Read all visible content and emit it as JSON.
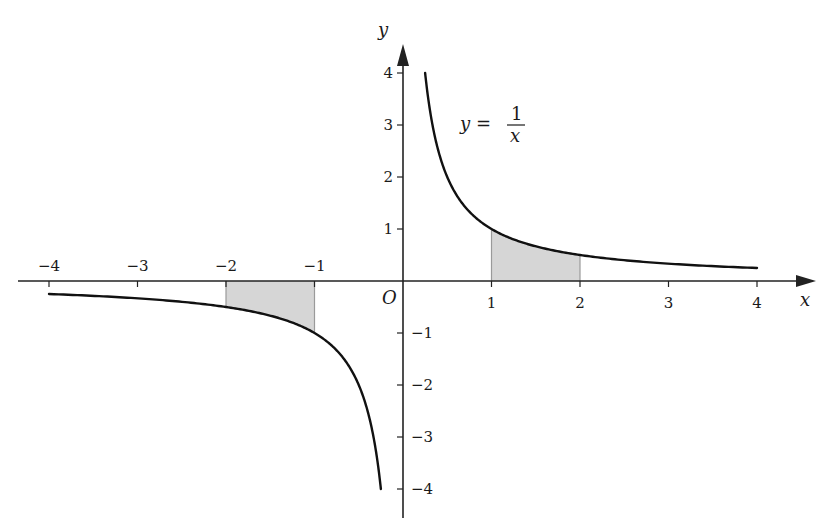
{
  "chart_data": {
    "type": "line",
    "title": "",
    "function": "y = 1/x",
    "xlabel": "x",
    "ylabel": "y",
    "origin_label": "O",
    "xlim": [
      -4.5,
      4.5
    ],
    "ylim": [
      -4.5,
      4.5
    ],
    "grid": false,
    "x_ticks": [
      -4,
      -3,
      -2,
      -1,
      1,
      2,
      3,
      4
    ],
    "y_ticks": [
      -4,
      -3,
      -2,
      -1,
      1,
      2,
      3,
      4
    ],
    "x_tick_labels": [
      "−4",
      "−3",
      "−2",
      "−1",
      "1",
      "2",
      "3",
      "4"
    ],
    "y_tick_labels": [
      "−4",
      "−3",
      "−2",
      "−1",
      "1",
      "2",
      "3",
      "4"
    ],
    "series": [
      {
        "name": "y = 1/x (x > 0)",
        "domain": [
          0.25,
          4
        ],
        "x": [
          0.25,
          0.5,
          1,
          1.5,
          2,
          3,
          4
        ],
        "y": [
          4,
          2,
          1,
          0.667,
          0.5,
          0.333,
          0.25
        ]
      },
      {
        "name": "y = 1/x (x < 0)",
        "domain": [
          -4,
          -0.25
        ],
        "x": [
          -4,
          -3,
          -2,
          -1.5,
          -1,
          -0.5,
          -0.25
        ],
        "y": [
          -0.25,
          -0.333,
          -0.5,
          -0.667,
          -1,
          -2,
          -4
        ]
      }
    ],
    "shaded_regions": [
      {
        "x_from": 1,
        "x_to": 2,
        "between": "curve and x-axis",
        "color": "#d6d6d6"
      },
      {
        "x_from": -2,
        "x_to": -1,
        "between": "curve and x-axis",
        "color": "#d6d6d6"
      }
    ],
    "annotations": [
      {
        "text": "y = 1/x",
        "near": [
          1.0,
          3.0
        ]
      }
    ]
  },
  "labels": {
    "x_axis": "x",
    "y_axis": "y",
    "origin": "O",
    "formula_lhs": "y =",
    "formula_num": "1",
    "formula_den": "x"
  },
  "colors": {
    "curve": "#111111",
    "axis": "#222222",
    "shade_fill": "#d6d6d6",
    "shade_edge": "#9a9a9a"
  }
}
